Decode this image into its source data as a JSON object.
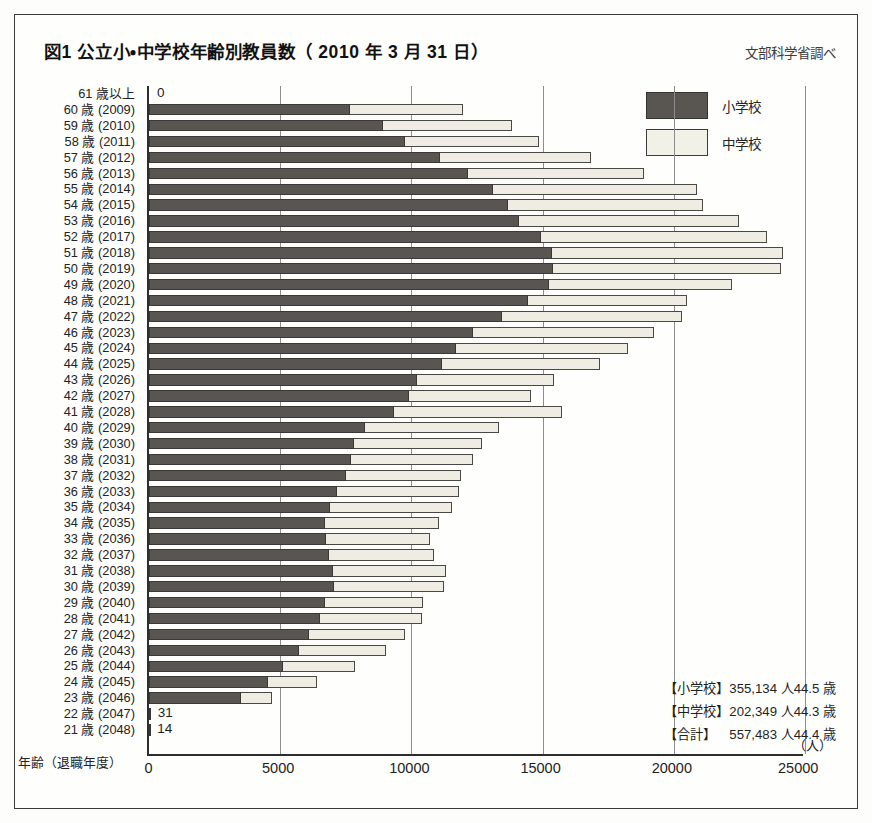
{
  "header": {
    "title": "図1 公立小・中学校年齢別教員数（ 2010 年 3 月 31 日）",
    "source": "文部科学省調べ"
  },
  "legend": {
    "items": [
      {
        "label": "小学校",
        "color": "#595550",
        "name": "legend-elementary"
      },
      {
        "label": "中学校",
        "color": "#f2f1e8",
        "name": "legend-junior-high"
      }
    ]
  },
  "axes": {
    "y_caption": "年齢（退職年度）",
    "x_unit": "（人）",
    "x_ticks": [
      "0",
      "5000",
      "10000",
      "15000",
      "20000",
      "25000"
    ]
  },
  "summary": {
    "rows": [
      {
        "category": "【小学校】",
        "count": "355,134 人",
        "avg_age": "44.5 歳"
      },
      {
        "category": "【中学校】",
        "count": "202,349 人",
        "avg_age": "44.3 歳"
      },
      {
        "category": "【合計】",
        "count": "557,483 人",
        "avg_age": "44.4 歳"
      }
    ]
  },
  "chart_data": {
    "type": "bar",
    "orientation": "horizontal",
    "stacked": true,
    "title": "図1 公立小・中学校年齢別教員数（ 2010 年 3 月 31 日）",
    "xlabel": "（人）",
    "ylabel": "年齢（退職年度）",
    "xlim": [
      0,
      25000
    ],
    "xticks": [
      0,
      5000,
      10000,
      15000,
      20000,
      25000
    ],
    "grid": true,
    "legend_position": "top-right",
    "categories": [
      "61 歳以上",
      "60 歳 (2009)",
      "59 歳 (2010)",
      "58 歳 (2011)",
      "57 歳 (2012)",
      "56 歳 (2013)",
      "55 歳 (2014)",
      "54 歳 (2015)",
      "53 歳 (2016)",
      "52 歳 (2017)",
      "51 歳 (2018)",
      "50 歳 (2019)",
      "49 歳 (2020)",
      "48 歳 (2021)",
      "47 歳 (2022)",
      "46 歳 (2023)",
      "45 歳 (2024)",
      "44 歳 (2025)",
      "43 歳 (2026)",
      "42 歳 (2027)",
      "41 歳 (2028)",
      "40 歳 (2029)",
      "39 歳 (2030)",
      "38 歳 (2031)",
      "37 歳 (2032)",
      "36 歳 (2033)",
      "35 歳 (2034)",
      "34 歳 (2035)",
      "33 歳 (2036)",
      "32 歳 (2037)",
      "31 歳 (2038)",
      "30 歳 (2039)",
      "29 歳 (2040)",
      "28 歳 (2041)",
      "27 歳 (2042)",
      "26 歳 (2043)",
      "25 歳 (2044)",
      "24 歳 (2045)",
      "23 歳 (2046)",
      "22 歳 (2047)",
      "21 歳 (2048)"
    ],
    "series": [
      {
        "name": "小学校",
        "color": "#595550",
        "values": [
          0,
          7650,
          8900,
          9750,
          11100,
          12150,
          13100,
          13700,
          14100,
          14950,
          15350,
          15400,
          15250,
          14450,
          13450,
          12350,
          11700,
          11150,
          10200,
          9900,
          9350,
          8250,
          7800,
          7700,
          7500,
          7150,
          6900,
          6700,
          6750,
          6850,
          7000,
          7050,
          6700,
          6500,
          6100,
          5700,
          5100,
          4550,
          3500,
          31,
          14
        ]
      },
      {
        "name": "中学校",
        "color": "#f2f1e8",
        "values": [
          0,
          4300,
          4950,
          5100,
          5750,
          6700,
          7800,
          7400,
          8400,
          8600,
          8800,
          8700,
          6950,
          6050,
          6850,
          6900,
          6550,
          6050,
          5250,
          4650,
          6400,
          5100,
          4900,
          4650,
          4400,
          4650,
          4650,
          4350,
          3950,
          4000,
          4300,
          4200,
          3750,
          3900,
          3650,
          3350,
          2750,
          1850,
          1200,
          0,
          0
        ]
      }
    ],
    "point_labels": [
      {
        "category": "61 歳以上",
        "text": "0"
      },
      {
        "category": "22 歳 (2047)",
        "text": "31"
      },
      {
        "category": "21 歳 (2048)",
        "text": "14"
      }
    ],
    "totals": {
      "小学校": 355134,
      "中学校": 202349,
      "合計": 557483
    },
    "average_age": {
      "小学校": 44.5,
      "中学校": 44.3,
      "合計": 44.4
    }
  }
}
